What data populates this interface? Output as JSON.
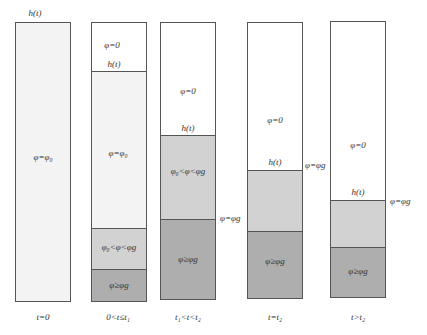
{
  "figure": {
    "caption": "",
    "colors": {
      "empty": "#ffffff",
      "initial": "#f3f3f3",
      "gel_forming": "#d2d2d2",
      "gelled": "#aeaeae",
      "border": "#555555"
    },
    "columns": [
      {
        "time_label": "t=0",
        "top_label": "h(t)",
        "regions": [
          {
            "label": "φ=φ₀",
            "type": "initial"
          }
        ]
      },
      {
        "time_label": "0<t≤t₁",
        "regions": [
          {
            "label": "φ=0",
            "type": "empty"
          },
          {
            "boundary_label": "h(t)"
          },
          {
            "label": "φ=φ₀",
            "type": "initial"
          },
          {
            "label": "φ₀<φ<φg",
            "type": "gel_forming"
          },
          {
            "label": "φ≥φg",
            "type": "gelled"
          }
        ]
      },
      {
        "time_label": "t₁<t<t₂",
        "side_label": "φ=φg",
        "regions": [
          {
            "label": "φ=0",
            "type": "empty"
          },
          {
            "boundary_label": "h(t)"
          },
          {
            "label": "φ₀<φ<φg",
            "type": "gel_forming"
          },
          {
            "label": "φ≥φg",
            "type": "gelled"
          }
        ]
      },
      {
        "time_label": "t=t₂",
        "side_label": "φ=φg",
        "regions": [
          {
            "label": "φ=0",
            "type": "empty"
          },
          {
            "boundary_label": "h(t)"
          },
          {
            "label": "",
            "type": "gel_forming"
          },
          {
            "label": "φ≥φg",
            "type": "gelled"
          }
        ]
      },
      {
        "time_label": "t>t₂",
        "side_label": "φ=φg",
        "regions": [
          {
            "label": "φ=0",
            "type": "empty"
          },
          {
            "boundary_label": "h(t)"
          },
          {
            "label": "",
            "type": "gel_forming"
          },
          {
            "label": "φ≥φg",
            "type": "gelled"
          }
        ]
      }
    ]
  }
}
